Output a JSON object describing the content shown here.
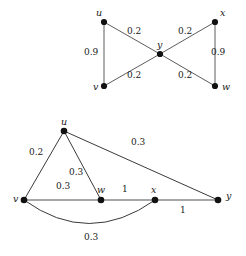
{
  "figure": {
    "background_color": "#ffffff",
    "width": 246,
    "height": 256
  },
  "graphs": [
    {
      "id": "top-graph",
      "name": "bowtie-graph",
      "vertices": [
        {
          "label": "u",
          "x": 104,
          "y": 22,
          "label_x": 96,
          "label_y": 8
        },
        {
          "label": "x",
          "x": 215,
          "y": 22,
          "label_x": 220,
          "label_y": 8
        },
        {
          "label": "y",
          "x": 160,
          "y": 54,
          "label_x": 157,
          "label_y": 40
        },
        {
          "label": "v",
          "x": 104,
          "y": 86,
          "label_x": 93,
          "label_y": 82
        },
        {
          "label": "w",
          "x": 215,
          "y": 86,
          "label_x": 222,
          "label_y": 82
        }
      ],
      "edges": [
        {
          "from": "u",
          "to": "v",
          "weight": "0.9",
          "weight_x": 84,
          "weight_y": 48
        },
        {
          "from": "x",
          "to": "w",
          "weight": "0.9",
          "weight_x": 211,
          "weight_y": 48
        },
        {
          "from": "u",
          "to": "y",
          "weight": "0.2",
          "weight_x": 127,
          "weight_y": 27
        },
        {
          "from": "x",
          "to": "y",
          "weight": "0.2",
          "weight_x": 178,
          "weight_y": 27
        },
        {
          "from": "v",
          "to": "y",
          "weight": "0.2",
          "weight_x": 127,
          "weight_y": 71
        },
        {
          "from": "w",
          "to": "y",
          "weight": "0.2",
          "weight_x": 178,
          "weight_y": 71
        }
      ]
    },
    {
      "id": "bottom-graph",
      "name": "weighted-path-graph",
      "vertices": [
        {
          "label": "u",
          "x": 64,
          "y": 131,
          "label_x": 61,
          "label_y": 117
        },
        {
          "label": "v",
          "x": 24,
          "y": 200,
          "label_x": 13,
          "label_y": 194
        },
        {
          "label": "w",
          "x": 101,
          "y": 200,
          "label_x": 97,
          "label_y": 185
        },
        {
          "label": "x",
          "x": 155,
          "y": 200,
          "label_x": 151,
          "label_y": 185
        },
        {
          "label": "y",
          "x": 218,
          "y": 200,
          "label_x": 226,
          "label_y": 191
        }
      ],
      "edges": [
        {
          "from": "u",
          "to": "v",
          "weight": "0.2",
          "weight_x": 29,
          "weight_y": 148
        },
        {
          "from": "u",
          "to": "w",
          "weight": "0.3",
          "weight_x": 69,
          "weight_y": 168
        },
        {
          "from": "u",
          "to": "y",
          "weight": "0.3",
          "weight_x": 131,
          "weight_y": 138
        },
        {
          "from": "v",
          "to": "w",
          "weight": "0.3",
          "weight_x": 56,
          "weight_y": 182
        },
        {
          "from": "w",
          "to": "x",
          "weight": "1",
          "weight_x": 122,
          "weight_y": 185
        },
        {
          "from": "x",
          "to": "y",
          "weight": "1",
          "weight_x": 180,
          "weight_y": 206
        },
        {
          "from": "v",
          "to": "x",
          "weight": "0.3",
          "weight_x": 84,
          "weight_y": 233,
          "curved": true
        }
      ]
    }
  ]
}
